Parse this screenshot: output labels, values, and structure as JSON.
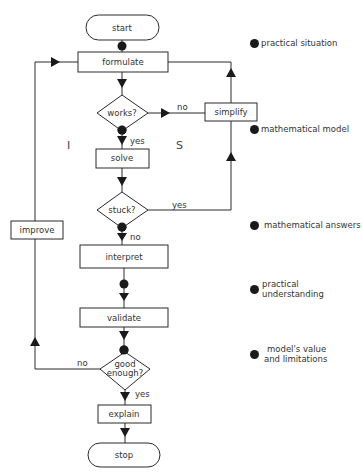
{
  "flowchart": {
    "terminals": {
      "start": "start",
      "stop": "stop"
    },
    "processes": {
      "formulate": "formulate",
      "simplify": "simplify",
      "solve": "solve",
      "improve": "improve",
      "interpret": "interpret",
      "validate": "validate",
      "explain": "explain"
    },
    "decisions": {
      "works": "works?",
      "stuck": "stuck?",
      "good_enough_line1": "good",
      "good_enough_line2": "enough?"
    },
    "edge_labels": {
      "works_no": "no",
      "works_yes": "yes",
      "stuck_yes": "yes",
      "stuck_no": "no",
      "good_no": "no",
      "good_yes": "yes"
    },
    "region_labels": {
      "left": "I",
      "right": "S"
    },
    "colors": {
      "stroke": "#2a2a2a",
      "fill": "#ffffff",
      "dot": "#1a1a1a"
    }
  },
  "legend": {
    "items": [
      {
        "label": "practical situation"
      },
      {
        "label": "mathematical model"
      },
      {
        "label": "mathematical answers"
      },
      {
        "label": "practical understanding"
      },
      {
        "label_line1": "model's value",
        "label_line2": "and limitations"
      }
    ]
  }
}
